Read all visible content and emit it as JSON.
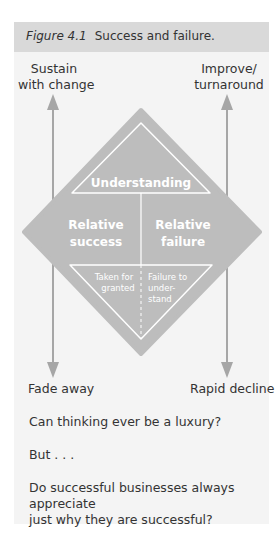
{
  "figure": {
    "number": "Figure 4.1",
    "title": "Success and failure."
  },
  "diagram": {
    "top_left_label": [
      "Sustain",
      "with change"
    ],
    "top_right_label": [
      "Improve/",
      "turnaround"
    ],
    "bottom_left_label": "Fade away",
    "bottom_right_label": "Rapid decline",
    "top_section": "Understanding",
    "left_section": [
      "Relative",
      "success"
    ],
    "right_section": [
      "Relative",
      "failure"
    ],
    "bottom_left_section": [
      "Taken for",
      "granted"
    ],
    "bottom_right_section": [
      "Failure to",
      "under-",
      "stand"
    ],
    "colors": {
      "diamond_fill": "#bdbdbd",
      "arrow": "#a6a6a6",
      "inner_line": "#ffffff"
    }
  },
  "body": {
    "q1": "Can thinking ever be a luxury?",
    "q2": "But . . .",
    "q3_line1": "Do successful businesses always appreciate",
    "q3_line2": "just why they are successful?"
  }
}
